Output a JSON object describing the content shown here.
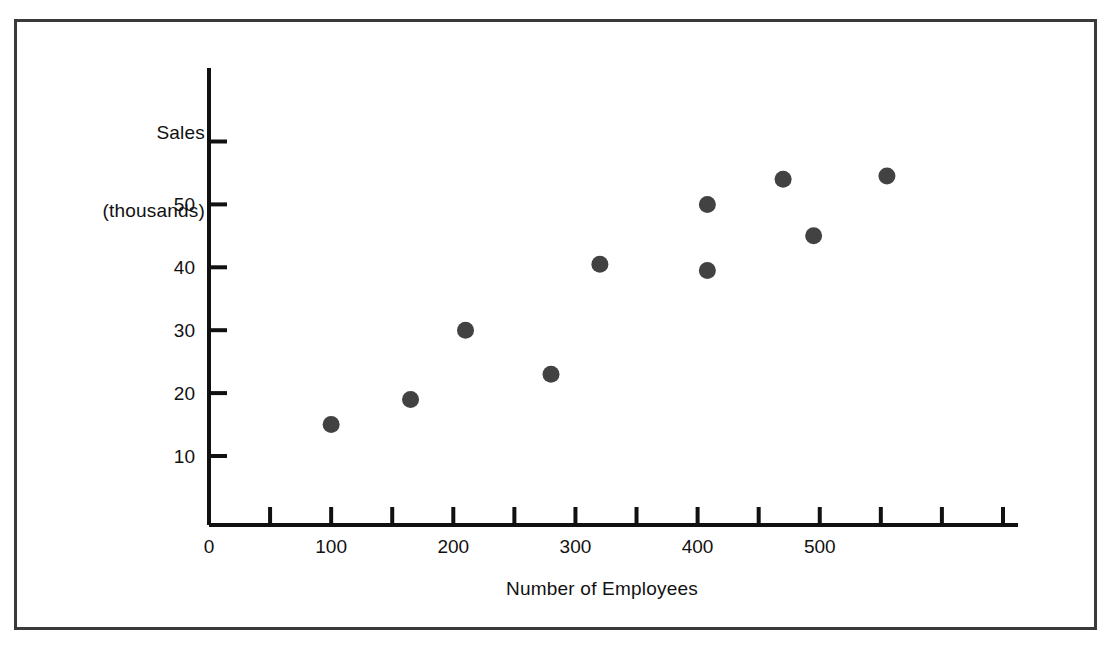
{
  "figure": {
    "background_color": "#ffffff",
    "border_color": "#3a3a3a",
    "marker_color": "#424242",
    "axis_color": "#111111"
  },
  "labels": {
    "y_axis_line1": "Sales",
    "y_axis_line2": "(thousands)",
    "x_axis": "Number of Employees"
  },
  "chart_data": {
    "type": "scatter",
    "title": "",
    "xlabel": "Number of Employees",
    "ylabel": "Sales (thousands)",
    "xlim": [
      0,
      662
    ],
    "ylim": [
      0,
      66
    ],
    "grid": false,
    "legend": null,
    "x_ticks": [
      0,
      50,
      100,
      150,
      200,
      250,
      300,
      350,
      400,
      450,
      500,
      550,
      600,
      650
    ],
    "x_tick_labels": [
      "0",
      "",
      "100",
      "",
      "200",
      "",
      "300",
      "",
      "400",
      "",
      "500",
      "",
      "",
      ""
    ],
    "y_ticks": [
      10,
      20,
      30,
      40,
      50,
      60
    ],
    "y_tick_labels": [
      "10",
      "20",
      "30",
      "40",
      "50",
      ""
    ],
    "series": [
      {
        "name": "Sales vs Employees",
        "marker": "filled-circle",
        "color": "#424242",
        "points": [
          {
            "x": 100,
            "y": 15
          },
          {
            "x": 165,
            "y": 19
          },
          {
            "x": 210,
            "y": 30
          },
          {
            "x": 280,
            "y": 23
          },
          {
            "x": 320,
            "y": 40.5
          },
          {
            "x": 408,
            "y": 39.5
          },
          {
            "x": 408,
            "y": 50
          },
          {
            "x": 470,
            "y": 54
          },
          {
            "x": 495,
            "y": 45
          },
          {
            "x": 555,
            "y": 54.5
          }
        ]
      }
    ]
  }
}
